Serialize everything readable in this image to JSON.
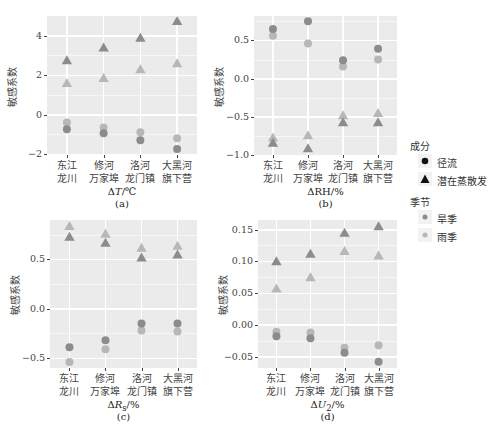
{
  "colors": {
    "panel_bg": "#ebebeb",
    "grid": "#ffffff",
    "dry_season": "#8c8c8c",
    "rainy_season": "#b7b7b7",
    "legend_black": "#111111"
  },
  "y_axis_label": "敏感系数",
  "categories": [
    [
      "东江",
      "龙川"
    ],
    [
      "修河",
      "万家埠"
    ],
    [
      "洛河",
      "龙门镇"
    ],
    [
      "大黑河",
      "旗下营"
    ]
  ],
  "legend": {
    "component_title": "成分",
    "component_items": [
      {
        "label": "径流",
        "shape": "circle"
      },
      {
        "label": "潜在蒸散发",
        "shape": "triangle"
      }
    ],
    "season_title": "季节",
    "season_items": [
      {
        "label": "旱季",
        "color": "#8c8c8c"
      },
      {
        "label": "雨季",
        "color": "#b7b7b7"
      }
    ]
  },
  "chart_data": [
    {
      "type": "scatter",
      "panel": "(a)",
      "xlabel": "ΔT/℃",
      "ylabel": "敏感系数",
      "categories": [
        "东江龙川",
        "修河万家埠",
        "洛河龙门镇",
        "大黑河旗下营"
      ],
      "ylim": [
        -2.05,
        5.0
      ],
      "yticks": [
        -2,
        0,
        2,
        4
      ],
      "ytick_labels": [
        "−2",
        "0",
        "2",
        "4"
      ],
      "series": [
        {
          "name": "径流-旱季",
          "shape": "circle",
          "season": "dry",
          "values": [
            -0.75,
            -0.95,
            -1.3,
            -1.75
          ]
        },
        {
          "name": "径流-雨季",
          "shape": "circle",
          "season": "rainy",
          "values": [
            -0.4,
            -0.65,
            -0.9,
            -1.2
          ]
        },
        {
          "name": "潜在蒸散发-旱季",
          "shape": "triangle",
          "season": "dry",
          "values": [
            2.75,
            3.4,
            3.9,
            4.75
          ]
        },
        {
          "name": "潜在蒸散发-雨季",
          "shape": "triangle",
          "season": "rainy",
          "values": [
            1.6,
            1.85,
            2.3,
            2.6
          ]
        }
      ]
    },
    {
      "type": "scatter",
      "panel": "(b)",
      "xlabel": "ΔRH/%",
      "ylabel": "敏感系数",
      "categories": [
        "东江龙川",
        "修河万家埠",
        "洛河龙门镇",
        "大黑河旗下营"
      ],
      "ylim": [
        -1.0,
        0.82
      ],
      "yticks": [
        -1.0,
        -0.5,
        0.0,
        0.5
      ],
      "ytick_labels": [
        "−1.0",
        "−0.5",
        "0.0",
        "0.5"
      ],
      "series": [
        {
          "name": "径流-旱季",
          "shape": "circle",
          "season": "dry",
          "values": [
            0.65,
            0.75,
            0.24,
            0.39
          ]
        },
        {
          "name": "径流-雨季",
          "shape": "circle",
          "season": "rainy",
          "values": [
            0.56,
            0.46,
            0.16,
            0.25
          ]
        },
        {
          "name": "潜在蒸散发-旱季",
          "shape": "triangle",
          "season": "dry",
          "values": [
            -0.84,
            -0.91,
            -0.57,
            -0.57
          ]
        },
        {
          "name": "潜在蒸散发-雨季",
          "shape": "triangle",
          "season": "rainy",
          "values": [
            -0.77,
            -0.74,
            -0.48,
            -0.45
          ]
        }
      ]
    },
    {
      "type": "scatter",
      "panel": "(c)",
      "xlabel": "ΔRs/%",
      "ylabel": "敏感系数",
      "categories": [
        "东江龙川",
        "修河万家埠",
        "洛河龙门镇",
        "大黑河旗下营"
      ],
      "ylim": [
        -0.6,
        0.9
      ],
      "yticks": [
        -0.5,
        0.0,
        0.5
      ],
      "ytick_labels": [
        "−0.5",
        "0.0",
        "0.5"
      ],
      "series": [
        {
          "name": "径流-旱季",
          "shape": "circle",
          "season": "dry",
          "values": [
            -0.39,
            -0.32,
            -0.15,
            -0.15
          ]
        },
        {
          "name": "径流-雨季",
          "shape": "circle",
          "season": "rainy",
          "values": [
            -0.54,
            -0.41,
            -0.22,
            -0.23
          ]
        },
        {
          "name": "潜在蒸散发-旱季",
          "shape": "triangle",
          "season": "dry",
          "values": [
            0.73,
            0.67,
            0.52,
            0.55
          ]
        },
        {
          "name": "潜在蒸散发-雨季",
          "shape": "triangle",
          "season": "rainy",
          "values": [
            0.84,
            0.76,
            0.62,
            0.64
          ]
        }
      ]
    },
    {
      "type": "scatter",
      "panel": "(d)",
      "xlabel": "ΔU2/%",
      "ylabel": "敏感系数",
      "categories": [
        "东江龙川",
        "修河万家埠",
        "洛河龙门镇",
        "大黑河旗下营"
      ],
      "ylim": [
        -0.068,
        0.165
      ],
      "yticks": [
        -0.05,
        0.0,
        0.05,
        0.1,
        0.15
      ],
      "ytick_labels": [
        "−0.05",
        "0.00",
        "0.05",
        "0.10",
        "0.15"
      ],
      "series": [
        {
          "name": "径流-旱季",
          "shape": "circle",
          "season": "dry",
          "values": [
            -0.018,
            -0.021,
            -0.044,
            -0.058
          ]
        },
        {
          "name": "径流-雨季",
          "shape": "circle",
          "season": "rainy",
          "values": [
            -0.011,
            -0.012,
            -0.036,
            -0.032
          ]
        },
        {
          "name": "潜在蒸散发-旱季",
          "shape": "triangle",
          "season": "dry",
          "values": [
            0.1,
            0.112,
            0.145,
            0.155
          ]
        },
        {
          "name": "潜在蒸散发-雨季",
          "shape": "triangle",
          "season": "rainy",
          "values": [
            0.057,
            0.075,
            0.116,
            0.109
          ]
        }
      ]
    }
  ],
  "panels_layout": [
    {
      "left": 47,
      "top": 16,
      "width": 150,
      "height": 139,
      "xtitle_html": "Δ<i>T</i>/℃"
    },
    {
      "left": 254,
      "top": 16,
      "width": 143,
      "height": 139,
      "xtitle_html": "ΔRH/%"
    },
    {
      "left": 50,
      "top": 220,
      "width": 147,
      "height": 148,
      "xtitle_html": "Δ<i>R</i><sub>s</sub>/%"
    },
    {
      "left": 258,
      "top": 220,
      "width": 139,
      "height": 148,
      "xtitle_html": "Δ<i>U</i><sub>2</sub>/%"
    }
  ]
}
